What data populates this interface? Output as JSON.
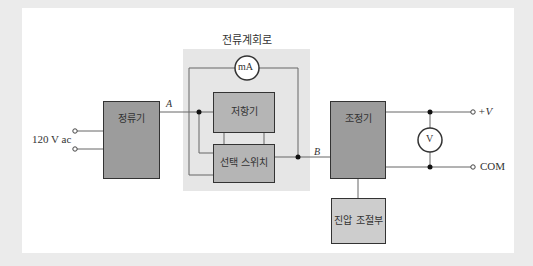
{
  "diagram": {
    "title": "전류계회로",
    "blocks": {
      "rectifier": "정류기",
      "resistor": "저항기",
      "selector_switch": "선택 스위치",
      "regulator": "조정기",
      "voltage_adjust": "진압 조절부"
    },
    "meters": {
      "ammeter": "mA",
      "voltmeter": "V"
    },
    "labels": {
      "input": "120 V ac",
      "node_a": "A",
      "node_b": "B",
      "out_pos": "+V",
      "out_com": "COM"
    },
    "colors": {
      "frame": "#ebebeb",
      "panel": "#ffffff",
      "shade": "#e6e6e6",
      "block_dark": "#9c9c9c",
      "block_light": "#cdcdcd",
      "wire": "#666666"
    }
  }
}
